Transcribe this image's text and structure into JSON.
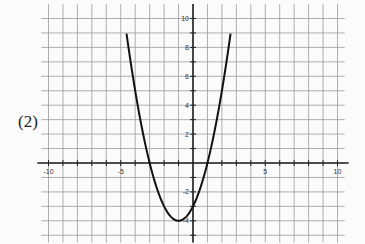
{
  "problem_label": "(2)",
  "chart_data": {
    "type": "line",
    "title": "",
    "xlabel": "",
    "ylabel": "",
    "xlim": [
      -10,
      10
    ],
    "ylim": [
      -5,
      11
    ],
    "grid": true,
    "x_tick_labels": [
      "-10",
      "-5",
      "5",
      "10"
    ],
    "y_tick_labels": [
      "10",
      "8",
      "6",
      "4",
      "2",
      "-2",
      "-4"
    ],
    "series": [
      {
        "name": "parabola",
        "equation": "y = (x + 1)^2 - 4",
        "vertex": [
          -1,
          -4
        ],
        "x_intercepts": [
          -3,
          1
        ],
        "y_intercept": -3,
        "x": [
          -4.6,
          -4,
          -3,
          -2,
          -1,
          0,
          1,
          2,
          2.6
        ],
        "y": [
          8.96,
          5,
          0,
          -3,
          -4,
          -3,
          0,
          5,
          8.96
        ]
      }
    ]
  },
  "colors": {
    "grid": "#9a9a9a",
    "axis": "#222222",
    "curve": "#111111",
    "background": "#fbfbfb"
  }
}
